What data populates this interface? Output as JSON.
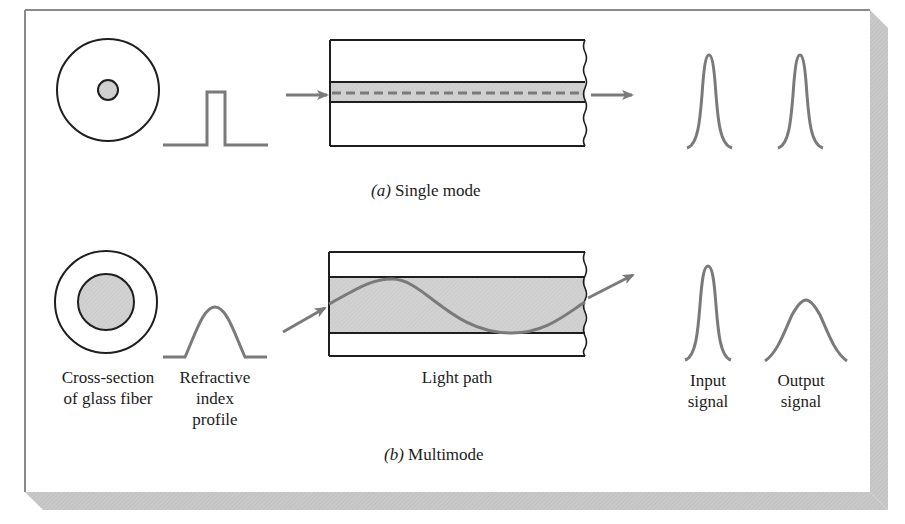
{
  "figure": {
    "panel_a": {
      "caption_letter": "(a)",
      "caption_text": "Single mode"
    },
    "panel_b": {
      "caption_letter": "(b)",
      "caption_text": "Multimode"
    },
    "labels": {
      "cross_section": [
        "Cross-section",
        "of glass fiber"
      ],
      "refractive_index": [
        "Refractive",
        "index",
        "profile"
      ],
      "light_path": "Light path",
      "input_signal": [
        "Input",
        "signal"
      ],
      "output_signal": [
        "Output",
        "signal"
      ]
    },
    "colors": {
      "line_gray": "#7a7a7a",
      "outline_dark": "#1e1e1e",
      "core_fill": "#cfcfcf",
      "shadow": "#c8c8c8",
      "panel_border": "#8a8a8a"
    }
  }
}
